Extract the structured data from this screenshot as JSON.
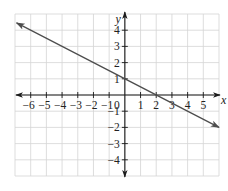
{
  "chart_data": {
    "type": "line",
    "title": "",
    "xlabel": "x",
    "ylabel": "y",
    "xlim": [
      -7,
      6
    ],
    "ylim": [
      -5,
      5
    ],
    "grid": true,
    "x_ticks": [
      -6,
      -5,
      -4,
      -3,
      -2,
      -1,
      1,
      2,
      3,
      4,
      5
    ],
    "y_ticks": [
      4,
      3,
      2,
      1,
      -1,
      -2,
      -3,
      -4
    ],
    "x_tick_labels": [
      "−6",
      "−5",
      "−4",
      "−3",
      "−2",
      "−1",
      "1",
      "2",
      "3",
      "4",
      "5"
    ],
    "y_tick_labels": [
      "4",
      "3",
      "2",
      "1",
      "−1",
      "−2",
      "−3",
      "−4"
    ],
    "origin_label": "0",
    "series": [
      {
        "name": "line",
        "equation": "y = -x/2 + 1",
        "slope": -0.5,
        "intercept": 1,
        "x": [
          -6.9,
          6
        ],
        "y": [
          4.45,
          -2
        ],
        "arrows": "both",
        "color": "#4d4d4d"
      }
    ]
  }
}
